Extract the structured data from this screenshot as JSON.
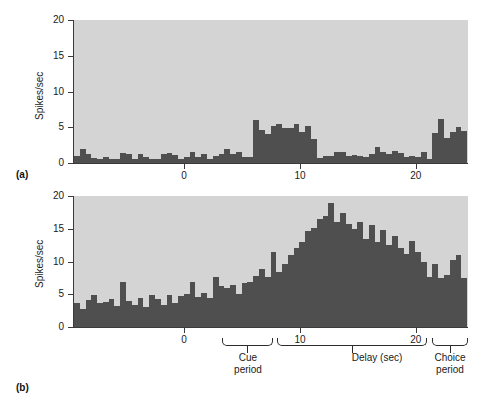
{
  "figure": {
    "panel_a_letter": "(a)",
    "panel_b_letter": "(b)",
    "background_color": "#ffffff",
    "plot_background_color": "#d4d4d4",
    "bar_color": "#4f4f4f",
    "axis_color": "#3a3a3a"
  },
  "annotations": {
    "cue_bracket_label": "Cue\nperiod",
    "delay_bracket_label": "Delay (sec)",
    "choice_bracket_label": "Choice\nperiod"
  },
  "chart_data": [
    {
      "id": "panel-a",
      "type": "bar",
      "title": "",
      "xlabel": "",
      "ylabel": "Spikes/sec",
      "ylim": [
        0,
        20
      ],
      "yticks": [
        0,
        5,
        10,
        15,
        20
      ],
      "ytick_labels": [
        "0",
        "5",
        "10",
        "15",
        "20"
      ],
      "xlim": [
        -9.5,
        24.5
      ],
      "xticks": [
        0,
        10,
        20
      ],
      "xtick_labels": [
        "0",
        "10",
        "20"
      ],
      "grid": false,
      "legend": "none",
      "bin_width": 0.5,
      "x": [
        -9.5,
        -9.0,
        -8.5,
        -8.0,
        -7.5,
        -7.0,
        -6.5,
        -6.0,
        -5.5,
        -5.0,
        -4.5,
        -4.0,
        -3.5,
        -3.0,
        -2.5,
        -2.0,
        -1.5,
        -1.0,
        -0.5,
        0.0,
        0.5,
        1.0,
        1.5,
        2.0,
        2.5,
        3.0,
        3.5,
        4.0,
        4.5,
        5.0,
        5.5,
        6.0,
        6.5,
        7.0,
        7.5,
        8.0,
        8.5,
        9.0,
        9.5,
        10.0,
        10.5,
        11.0,
        11.5,
        12.0,
        12.5,
        13.0,
        13.5,
        14.0,
        14.5,
        15.0,
        15.5,
        16.0,
        16.5,
        17.0,
        17.5,
        18.0,
        18.5,
        19.0,
        19.5,
        20.0,
        20.5,
        21.0,
        21.5,
        22.0,
        22.5,
        23.0,
        23.5,
        24.0
      ],
      "values": [
        1.0,
        2.0,
        1.2,
        0.7,
        0.6,
        0.9,
        0.6,
        0.6,
        1.4,
        1.3,
        0.6,
        1.3,
        0.9,
        0.6,
        0.6,
        1.3,
        1.4,
        1.1,
        0.6,
        0.9,
        1.5,
        0.8,
        1.3,
        0.6,
        1.0,
        1.3,
        1.9,
        1.2,
        1.5,
        0.8,
        0.8,
        6.0,
        4.6,
        4.0,
        5.2,
        5.4,
        4.9,
        4.9,
        5.4,
        4.3,
        5.2,
        3.4,
        0.7,
        1.0,
        1.0,
        1.6,
        1.6,
        1.0,
        1.1,
        1.0,
        0.8,
        1.2,
        2.2,
        1.5,
        1.2,
        1.7,
        1.4,
        0.9,
        1.0,
        0.8,
        1.5,
        0.6,
        4.2,
        6.2,
        3.5,
        4.3,
        5.0,
        4.5
      ]
    },
    {
      "id": "panel-b",
      "type": "bar",
      "title": "",
      "xlabel": "",
      "ylabel": "Spikes/sec",
      "ylim": [
        0,
        20
      ],
      "yticks": [
        0,
        5,
        10,
        15,
        20
      ],
      "ytick_labels": [
        "0",
        "5",
        "10",
        "15",
        "20"
      ],
      "xlim": [
        -9.5,
        24.5
      ],
      "xticks": [
        0,
        10,
        20
      ],
      "xtick_labels": [
        "0",
        "10",
        "20"
      ],
      "grid": false,
      "legend": "none",
      "bin_width": 0.5,
      "x": [
        -9.5,
        -9.0,
        -8.5,
        -8.0,
        -7.5,
        -7.0,
        -6.5,
        -6.0,
        -5.5,
        -5.0,
        -4.5,
        -4.0,
        -3.5,
        -3.0,
        -2.5,
        -2.0,
        -1.5,
        -1.0,
        -0.5,
        0.0,
        0.5,
        1.0,
        1.5,
        2.0,
        2.5,
        3.0,
        3.5,
        4.0,
        4.5,
        5.0,
        5.5,
        6.0,
        6.5,
        7.0,
        7.5,
        8.0,
        8.5,
        9.0,
        9.5,
        10.0,
        10.5,
        11.0,
        11.5,
        12.0,
        12.5,
        13.0,
        13.5,
        14.0,
        14.5,
        15.0,
        15.5,
        16.0,
        16.5,
        17.0,
        17.5,
        18.0,
        18.5,
        19.0,
        19.5,
        20.0,
        20.5,
        21.0,
        21.5,
        22.0,
        22.5,
        23.0,
        23.5,
        24.0
      ],
      "values": [
        3.7,
        2.7,
        4.1,
        4.9,
        3.6,
        3.8,
        4.3,
        3.2,
        6.8,
        4.0,
        3.4,
        4.4,
        3.1,
        4.9,
        4.3,
        3.4,
        4.9,
        3.6,
        4.8,
        5.0,
        6.9,
        4.6,
        5.2,
        4.4,
        7.7,
        6.2,
        6.0,
        6.4,
        5.1,
        6.7,
        6.8,
        7.8,
        8.9,
        7.6,
        11.5,
        8.4,
        9.6,
        11.0,
        12.0,
        13.0,
        14.6,
        15.1,
        16.5,
        17.0,
        19.0,
        16.0,
        17.4,
        15.8,
        15.0,
        16.0,
        13.5,
        15.6,
        13.0,
        14.8,
        12.5,
        13.9,
        12.0,
        11.1,
        13.2,
        11.5,
        10.0,
        7.6,
        9.6,
        7.5,
        8.0,
        10.2,
        11.0,
        7.5
      ]
    }
  ]
}
